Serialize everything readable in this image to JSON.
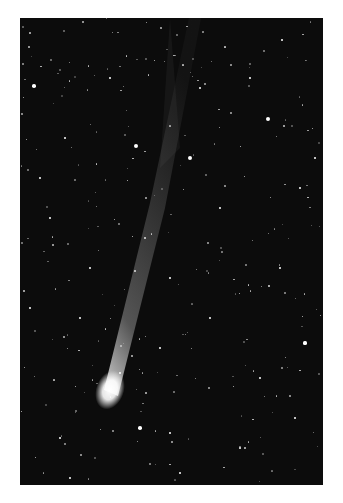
{
  "image": {
    "subject": "comet with long ion tail against star field",
    "background_color": "#0c0c0c",
    "border_color": "#ffffff",
    "comet_head_color": "#ffffff",
    "stars": [
      [
        14,
        68,
        1.8
      ],
      [
        116,
        128,
        2
      ],
      [
        170,
        140,
        2.2
      ],
      [
        248,
        101,
        2
      ],
      [
        45,
        120,
        1.2
      ],
      [
        262,
        22,
        1.2
      ],
      [
        180,
        70,
        1
      ],
      [
        90,
        60,
        1
      ],
      [
        200,
        190,
        1
      ],
      [
        30,
        200,
        1
      ],
      [
        280,
        170,
        1.3
      ],
      [
        260,
        250,
        1
      ],
      [
        150,
        260,
        1
      ],
      [
        60,
        300,
        1
      ],
      [
        285,
        325,
        1.6
      ],
      [
        120,
        410,
        1.8
      ],
      [
        150,
        415,
        1.2
      ],
      [
        100,
        355,
        1
      ],
      [
        240,
        360,
        1
      ],
      [
        40,
        420,
        1
      ],
      [
        220,
        430,
        1
      ],
      [
        190,
        300,
        1
      ],
      [
        70,
        250,
        1
      ],
      [
        10,
        290,
        1
      ],
      [
        295,
        140,
        1.2
      ],
      [
        230,
        60,
        1
      ],
      [
        20,
        160,
        1
      ],
      [
        140,
        330,
        1
      ],
      [
        275,
        400,
        1
      ],
      [
        50,
        460,
        1
      ],
      [
        160,
        455,
        1
      ],
      [
        300,
        470,
        1
      ]
    ]
  }
}
